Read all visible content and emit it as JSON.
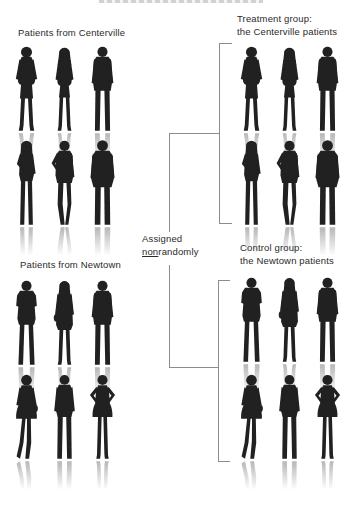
{
  "colors": {
    "silhouette": "#212121",
    "text": "#2b2b2b",
    "line": "#8c8c8c"
  },
  "assignment": {
    "line1": "Assigned",
    "underlined": "non",
    "rest": "randomly"
  },
  "groups": {
    "centerville": {
      "label": "Patients from Centerville",
      "figures": [
        [
          "woman-dress",
          "woman-long-hair",
          "man-standing"
        ],
        [
          "woman-pants",
          "man-hand-on-hip",
          "man-large"
        ]
      ]
    },
    "newtown": {
      "label": "Patients from Newtown",
      "figures": [
        [
          "man-arms-crossed",
          "woman-coat-bag",
          "man-standing"
        ],
        [
          "woman-skirt-bag",
          "man-casual",
          "woman-hands-on-hips"
        ]
      ]
    },
    "treatment": {
      "line1": "Treatment group:",
      "line2": "the Centerville patients",
      "figures": [
        [
          "woman-dress",
          "woman-long-hair",
          "man-standing"
        ],
        [
          "woman-pants",
          "man-hand-on-hip",
          "man-large"
        ]
      ]
    },
    "control": {
      "line1": "Control group:",
      "line2": "the Newtown patients",
      "figures": [
        [
          "man-arms-crossed",
          "woman-coat-bag",
          "man-standing"
        ],
        [
          "woman-skirt-bag",
          "man-casual",
          "woman-hands-on-hips"
        ]
      ]
    }
  }
}
